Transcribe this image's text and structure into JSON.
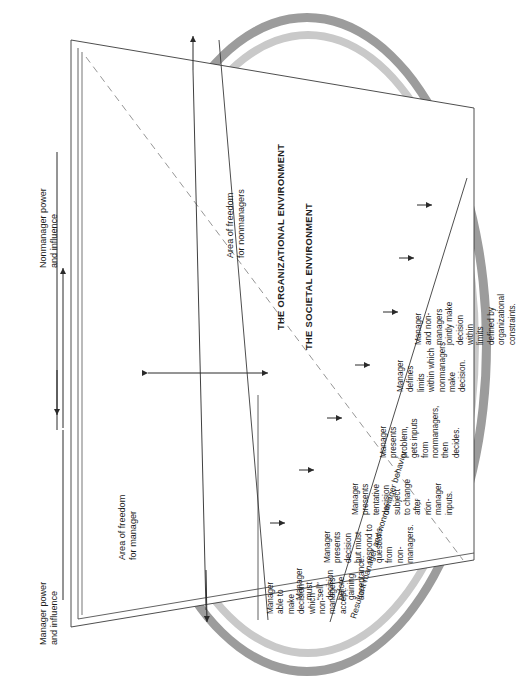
{
  "diagram": {
    "axis_labels": {
      "nonmanager_power": "Nonmanager power\nand influence",
      "manager_power": "Manager power\nand influence"
    },
    "areas": {
      "manager": "Area of freedom\nfor manager",
      "nonmanager": "Area of freedom\nfor nonmanagers"
    },
    "resultant": "Resultant manager and nonmanager behavior",
    "rings": {
      "organizational": "THE ORGANIZATIONAL ENVIRONMENT",
      "societal": "THE SOCIETAL ENVIRONMENT"
    },
    "steps": [
      {
        "id": 1,
        "text": "Manager\nable to\nmake\ndecision\nwhich\nnon-\nmanagers\naccept."
      },
      {
        "id": 2,
        "text": "Manager\nmust\n“sell”\ndecision\nbefore\ngaining\nacceptance."
      },
      {
        "id": 3,
        "text": "Manager\npresents\ndecision\nbut must\nrespond to\nquestions\nfrom\nnon-\nmanagers."
      },
      {
        "id": 4,
        "text": "Manager\npresents\ntentative\ndecision\nsubject\nto change\nafter\nnon-\nmanager\ninputs."
      },
      {
        "id": 5,
        "text": "Manager\npresents\nproblem,\ngets inputs\nfrom\nnonmanagers,\nthen\ndecides."
      },
      {
        "id": 6,
        "text": "Manager\ndefines\nlimits\nwithin which\nnonmanagers\nmake\ndecision."
      },
      {
        "id": 7,
        "text": "Manager\nand non-\nmanagers\njointly make\ndecision\nwithin\nlimits\ndefined by\norganizational\nconstraints."
      }
    ],
    "colors": {
      "ring_outer": "#9c9c9c",
      "ring_inner": "#c9c9c9",
      "line": "#3a3a3a",
      "text": "#1b1b1b"
    }
  }
}
